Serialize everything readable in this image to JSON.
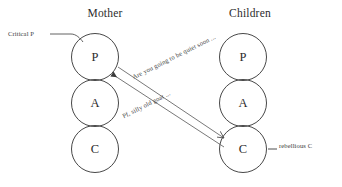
{
  "diagram": {
    "type": "transactional-analysis-pac",
    "columns": [
      {
        "id": "mother",
        "heading": "Mother",
        "ego_states": [
          {
            "id": "mother-p",
            "letter": "P"
          },
          {
            "id": "mother-a",
            "letter": "A"
          },
          {
            "id": "mother-c",
            "letter": "C"
          }
        ]
      },
      {
        "id": "children",
        "heading": "Children",
        "ego_states": [
          {
            "id": "children-p",
            "letter": "P"
          },
          {
            "id": "children-a",
            "letter": "A"
          },
          {
            "id": "children-c",
            "letter": "C"
          }
        ]
      }
    ],
    "annotations": [
      {
        "id": "critical-p",
        "text": "Critical P"
      },
      {
        "id": "rebellious-c",
        "text": "rebellious C"
      }
    ],
    "transactions": [
      {
        "id": "stimulus",
        "text": "Are you going to be quiet soon ...",
        "from": "mother-p",
        "to": "children-c"
      },
      {
        "id": "response",
        "text": "Pf, silly old goat ...",
        "from": "children-c",
        "to": "mother-p"
      }
    ],
    "colors": {
      "stroke": "#333333",
      "text": "#2b2b2b",
      "background": "#ffffff"
    }
  }
}
